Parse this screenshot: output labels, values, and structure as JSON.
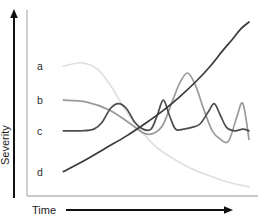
{
  "chart_data": {
    "type": "line",
    "title": "",
    "xlabel": "Time",
    "ylabel": "Severity",
    "grid": false,
    "legend_position": "inline-left",
    "axis_style": "arrows",
    "xlim": [
      0,
      100
    ],
    "ylim": [
      0,
      100
    ],
    "x_ticks": [],
    "y_ticks": [],
    "annotations": [
      {
        "text": "a",
        "x": 2,
        "y": 74
      },
      {
        "text": "b",
        "x": 2,
        "y": 54
      },
      {
        "text": "c",
        "x": 2,
        "y": 36
      },
      {
        "text": "d",
        "x": 2,
        "y": 12
      }
    ],
    "series": [
      {
        "name": "a",
        "label": "a",
        "color": "#e0e0e0",
        "description": "rises briefly then decays steadily toward zero",
        "x": [
          9,
          18,
          26,
          33,
          40,
          47,
          54,
          61,
          68,
          75,
          82,
          89,
          96,
          100
        ],
        "y": [
          74,
          76,
          72,
          61,
          47,
          36,
          27,
          21,
          16,
          12,
          9,
          6,
          4,
          3
        ]
      },
      {
        "name": "b",
        "label": "b",
        "color": "#9a9a9a",
        "description": "gentle decline then a tall late peak and a second smaller peak",
        "x": [
          9,
          20,
          32,
          42,
          50,
          57,
          62,
          66,
          70,
          74,
          78,
          82,
          86,
          90,
          94,
          97,
          100
        ],
        "y": [
          54,
          53,
          48,
          40,
          34,
          38,
          52,
          64,
          70,
          62,
          48,
          36,
          31,
          30,
          44,
          52,
          31
        ]
      },
      {
        "name": "c",
        "label": "c",
        "color": "#4d4d4d",
        "description": "flat baseline punctuated by intermittent spikes",
        "x": [
          9,
          18,
          24,
          28,
          32,
          36,
          40,
          44,
          48,
          52,
          55,
          58,
          61,
          64,
          68,
          72,
          76,
          80,
          83,
          86,
          89,
          93,
          97,
          100
        ],
        "y": [
          36,
          36,
          37,
          41,
          49,
          52,
          49,
          41,
          37,
          37,
          45,
          54,
          45,
          37,
          37,
          38,
          40,
          47,
          52,
          45,
          38,
          36,
          37,
          36
        ]
      },
      {
        "name": "d",
        "label": "d",
        "color": "#3a3a3a",
        "description": "monotonic accelerating rise",
        "x": [
          9,
          20,
          30,
          40,
          50,
          58,
          66,
          74,
          81,
          87,
          92,
          96,
          100
        ],
        "y": [
          12,
          19,
          26,
          33,
          41,
          48,
          56,
          65,
          74,
          83,
          90,
          96,
          100
        ]
      }
    ]
  },
  "axes": {
    "x_label": "Time",
    "y_label": "Severity"
  }
}
